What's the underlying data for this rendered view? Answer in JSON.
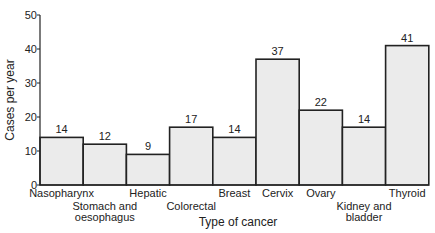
{
  "chart_data": {
    "type": "bar",
    "title": "",
    "xlabel": "Type of cancer",
    "ylabel": "Cases per year",
    "ylim": [
      0,
      50
    ],
    "yticks": [
      0,
      10,
      20,
      30,
      40,
      50
    ],
    "grid": false,
    "categories": [
      [
        "Nasopharynx"
      ],
      [
        "Stomach and",
        "oesophagus"
      ],
      [
        "Hepatic"
      ],
      [
        "Colorectal"
      ],
      [
        "Breast"
      ],
      [
        "Cervix"
      ],
      [
        "Ovary"
      ],
      [
        "Kidney and",
        "bladder"
      ],
      [
        "Thyroid"
      ]
    ],
    "values": [
      14,
      12,
      9,
      17,
      14,
      37,
      22,
      14,
      41
    ],
    "bar_heights_drawn": [
      14,
      12,
      9,
      17,
      14,
      37,
      22,
      17,
      41
    ],
    "label_row": [
      0,
      1,
      0,
      1,
      0,
      0,
      0,
      1,
      0
    ],
    "bar_fill": "#ebebeb",
    "bar_stroke": "#222222"
  }
}
